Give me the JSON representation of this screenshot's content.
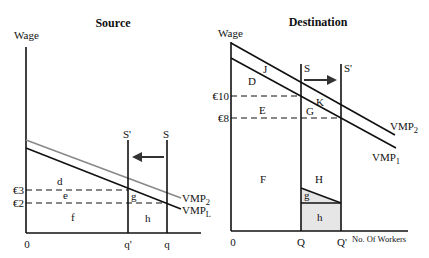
{
  "source": {
    "title": "Source",
    "y_axis_label": "Wage",
    "origin_label": "0",
    "wage_labels": {
      "high": "€3",
      "low": "€2"
    },
    "supply_labels": {
      "original": "S",
      "shifted": "S'"
    },
    "quantity_labels": {
      "shifted": "q'",
      "original": "q"
    },
    "curve_labels": {
      "upper": "VMP",
      "upper_sub": "2",
      "lower": "VMP",
      "lower_sub": "L"
    },
    "area_labels": {
      "d": "d",
      "e": "e",
      "f": "f",
      "g": "g",
      "h": "h"
    },
    "arrow_direction": "left"
  },
  "destination": {
    "title": "Destination",
    "y_axis_label": "Wage",
    "x_axis_label": "No. Of Workers",
    "origin_label": "0",
    "wage_labels": {
      "high": "€10",
      "low": "€8"
    },
    "supply_labels": {
      "original": "S",
      "shifted": "S'"
    },
    "quantity_labels": {
      "original": "Q",
      "shifted": "Q'"
    },
    "curve_labels": {
      "upper": "VMP",
      "upper_sub": "2",
      "lower": "VMP",
      "lower_sub": "1"
    },
    "area_labels": {
      "J": "J",
      "D": "D",
      "K": "K",
      "E": "E",
      "G": "G",
      "F": "F",
      "H": "H",
      "g": "g",
      "h": "h"
    },
    "arrow_direction": "right",
    "shaded_fill": "#e6e6e6"
  }
}
